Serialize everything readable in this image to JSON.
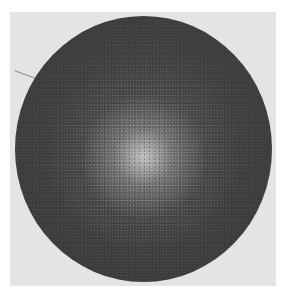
{
  "image": {
    "description": "Grayscale photograph of a dark circular disk with a speckled bright center on a light gray background",
    "colors": {
      "page_background": "#ffffff",
      "photo_background": "#e4e4e4",
      "disk": "#3b3b3b",
      "highlight": "#d2d2d2"
    }
  }
}
